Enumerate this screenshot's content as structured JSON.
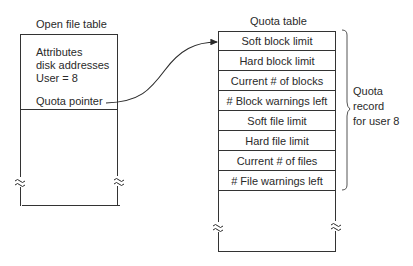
{
  "open_file_table": {
    "title": "Open file table",
    "fields": [
      "Attributes",
      "disk addresses",
      "User = 8"
    ],
    "pointer_label": "Quota pointer"
  },
  "quota_table": {
    "title": "Quota table",
    "rows": [
      "Soft block limit",
      "Hard block limit",
      "Current # of blocks",
      "# Block warnings left",
      "Soft file limit",
      "Hard file limit",
      "Current # of files",
      "# File warnings left"
    ]
  },
  "brace_label": {
    "line1": "Quota",
    "line2": "record",
    "line3": "for user 8"
  },
  "break_symbol": "≈"
}
